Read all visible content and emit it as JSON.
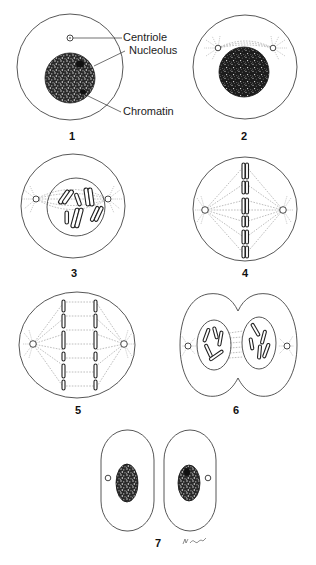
{
  "labels": {
    "centriole": "Centriole",
    "nucleolus": "Nucleolus",
    "chromatin": "Chromatin"
  },
  "stages": [
    {
      "number": "1",
      "description": "Interphase cell with centriole, nucleolus and chromatin"
    },
    {
      "number": "2",
      "description": "Early prophase: centrioles separating, dense nucleus"
    },
    {
      "number": "3",
      "description": "Prophase: condensed chromosomes within nuclear envelope, spindle forming"
    },
    {
      "number": "4",
      "description": "Metaphase: chromosomes aligned at equator, spindle fibers to poles"
    },
    {
      "number": "5",
      "description": "Anaphase: sister chromatids separating toward poles"
    },
    {
      "number": "6",
      "description": "Telophase: cleavage furrow, two nuclei forming"
    },
    {
      "number": "7",
      "description": "Two daughter cells"
    }
  ],
  "signature": "M. Carol",
  "colors": {
    "line": "#444444",
    "nucleus_fill": "#1a1a1a",
    "background": "#ffffff"
  }
}
